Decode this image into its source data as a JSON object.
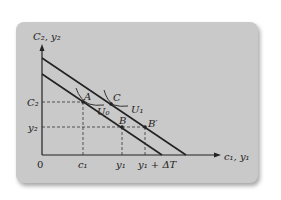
{
  "diagram": {
    "type": "intertemporal-budget-constraint",
    "axes": {
      "y_label": "C₂, y₂",
      "x_label": "c₁, y₁",
      "origin": "0"
    },
    "y_ticks": [
      {
        "label": "C₂",
        "value": "C2"
      },
      {
        "label": "y₂",
        "value": "y2"
      }
    ],
    "x_ticks": [
      {
        "label": "c₁",
        "value": "c1"
      },
      {
        "label": "y₁",
        "value": "y1"
      },
      {
        "label": "y₁ + ΔT",
        "value": "y1+dT"
      }
    ],
    "lines": [
      {
        "name": "original-budget-line"
      },
      {
        "name": "shifted-budget-line"
      }
    ],
    "points": [
      {
        "label": "A"
      },
      {
        "label": "B"
      },
      {
        "label": "C"
      },
      {
        "label": "B′"
      }
    ],
    "curves": [
      {
        "label": "U₀"
      },
      {
        "label": "U₁"
      }
    ],
    "colors": {
      "card": "#c9c9c9",
      "ink": "#222222"
    }
  }
}
